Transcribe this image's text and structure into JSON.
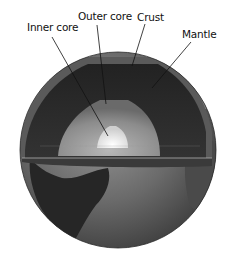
{
  "figure": {
    "labels": [
      {
        "id": "inner-core",
        "text": "Inner core",
        "x": 27,
        "y": 21
      },
      {
        "id": "outer-core",
        "text": "Outer core",
        "x": 78,
        "y": 10
      },
      {
        "id": "crust",
        "text": "Crust",
        "x": 137,
        "y": 11
      },
      {
        "id": "mantle",
        "text": "Mantle",
        "x": 182,
        "y": 28
      }
    ],
    "colors": {
      "background": "#ffffff",
      "label_text": "#111111",
      "leader_line": "#111111",
      "mantle": "#2a2a2a",
      "outer_core": "#8a8a8a",
      "inner_core": "#e8e8e8",
      "ocean": "#6e6e6e",
      "land": "#2f2f2f"
    }
  }
}
